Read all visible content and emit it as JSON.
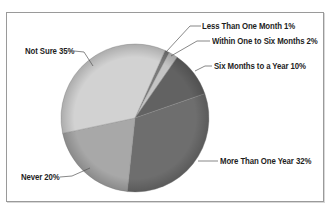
{
  "chart_data": {
    "type": "pie",
    "title": "",
    "start_angle_deg": 24,
    "direction": "clockwise",
    "slices": [
      {
        "label": "Less Than One Month",
        "value": 1,
        "display": "Less Than One Month 1%",
        "color": "#7a7a7a"
      },
      {
        "label": "Within One to Six Months",
        "value": 2,
        "display": "Within One to Six Months 2%",
        "color": "#c4c4c4"
      },
      {
        "label": "Six Months to a Year",
        "value": 10,
        "display": "Six Months to a Year 10%",
        "color": "#626262"
      },
      {
        "label": "More Than One Year",
        "value": 32,
        "display": "More Than One Year 32%",
        "color": "#6e6e6e"
      },
      {
        "label": "Never",
        "value": 20,
        "display": "Never 20%",
        "color": "#a8a8a8"
      },
      {
        "label": "Not Sure",
        "value": 35,
        "display": "Not Sure 35%",
        "color": "#d2d2d2"
      }
    ],
    "legend": "none (callout labels)"
  },
  "labels": {
    "less_than_one_month": "Less Than One Month 1%",
    "within_one_to_six": "Within One to Six Months 2%",
    "six_months_to_year": "Six Months to a Year 10%",
    "more_than_one_year": "More Than One Year 32%",
    "never": "Never 20%",
    "not_sure": "Not Sure 35%"
  }
}
